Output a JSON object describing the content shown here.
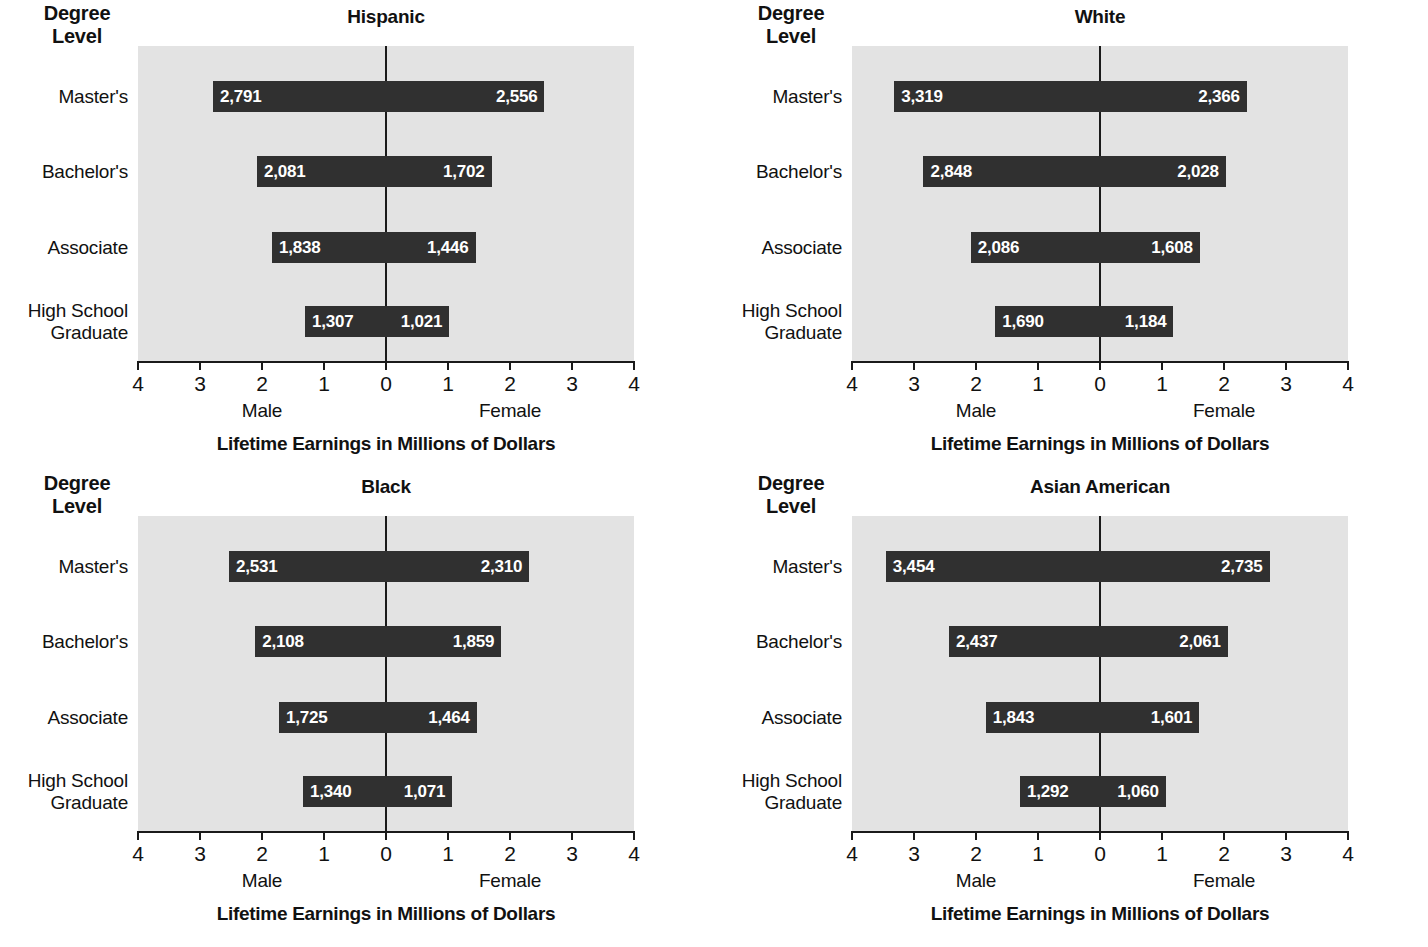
{
  "common": {
    "degree_level_heading": "Degree\nLevel",
    "degree_level_line1": "Degree",
    "degree_level_line2": "Level",
    "x_axis_title": "Lifetime Earnings in Millions of Dollars",
    "male_label": "Male",
    "female_label": "Female",
    "tick_labels": [
      "4",
      "3",
      "2",
      "1",
      "0",
      "1",
      "2",
      "3",
      "4"
    ],
    "tick_values": [
      -4,
      -3,
      -2,
      -1,
      0,
      1,
      2,
      3,
      4
    ],
    "categories": [
      "Master's",
      "Bachelor's",
      "Associate",
      "High School Graduate"
    ],
    "category_lines": [
      [
        "Master's"
      ],
      [
        "Bachelor's"
      ],
      [
        "Associate"
      ],
      [
        "High School",
        "Graduate"
      ]
    ],
    "colors": {
      "plot_background": "#e3e3e3",
      "bar_fill": "#303030",
      "axis": "#1a1a1a",
      "text": "#111111",
      "value_label": "#ffffff",
      "page_background": "#ffffff"
    }
  },
  "chart_data": [
    {
      "type": "bar",
      "orientation": "horizontal-diverging",
      "title": "Hispanic",
      "xlabel": "Lifetime Earnings in Millions of Dollars",
      "ylabel": "Degree Level",
      "xlim": [
        -4,
        4
      ],
      "xticks": [
        -4,
        -3,
        -2,
        -1,
        0,
        1,
        2,
        3,
        4
      ],
      "xticklabels": [
        "4",
        "3",
        "2",
        "1",
        "0",
        "1",
        "2",
        "3",
        "4"
      ],
      "grid": false,
      "legend": "none",
      "units": "thousands of dollars (bar labels); millions of dollars (axis)",
      "categories": [
        "Master's",
        "Bachelor's",
        "Associate",
        "High School Graduate"
      ],
      "series": [
        {
          "name": "Male",
          "side": "left",
          "values": [
            2791,
            2081,
            1838,
            1307
          ],
          "labels": [
            "2,791",
            "2,081",
            "1,838",
            "1,307"
          ]
        },
        {
          "name": "Female",
          "side": "right",
          "values": [
            2556,
            1702,
            1446,
            1021
          ],
          "labels": [
            "2,556",
            "1,702",
            "1,446",
            "1,021"
          ]
        }
      ]
    },
    {
      "type": "bar",
      "orientation": "horizontal-diverging",
      "title": "White",
      "xlabel": "Lifetime Earnings in Millions of Dollars",
      "ylabel": "Degree Level",
      "xlim": [
        -4,
        4
      ],
      "xticks": [
        -4,
        -3,
        -2,
        -1,
        0,
        1,
        2,
        3,
        4
      ],
      "xticklabels": [
        "4",
        "3",
        "2",
        "1",
        "0",
        "1",
        "2",
        "3",
        "4"
      ],
      "grid": false,
      "legend": "none",
      "units": "thousands of dollars (bar labels); millions of dollars (axis)",
      "categories": [
        "Master's",
        "Bachelor's",
        "Associate",
        "High School Graduate"
      ],
      "series": [
        {
          "name": "Male",
          "side": "left",
          "values": [
            3319,
            2848,
            2086,
            1690
          ],
          "labels": [
            "3,319",
            "2,848",
            "2,086",
            "1,690"
          ]
        },
        {
          "name": "Female",
          "side": "right",
          "values": [
            2366,
            2028,
            1608,
            1184
          ],
          "labels": [
            "2,366",
            "2,028",
            "1,608",
            "1,184"
          ]
        }
      ]
    },
    {
      "type": "bar",
      "orientation": "horizontal-diverging",
      "title": "Black",
      "xlabel": "Lifetime Earnings in Millions of Dollars",
      "ylabel": "Degree Level",
      "xlim": [
        -4,
        4
      ],
      "xticks": [
        -4,
        -3,
        -2,
        -1,
        0,
        1,
        2,
        3,
        4
      ],
      "xticklabels": [
        "4",
        "3",
        "2",
        "1",
        "0",
        "1",
        "2",
        "3",
        "4"
      ],
      "grid": false,
      "legend": "none",
      "units": "thousands of dollars (bar labels); millions of dollars (axis)",
      "categories": [
        "Master's",
        "Bachelor's",
        "Associate",
        "High School Graduate"
      ],
      "series": [
        {
          "name": "Male",
          "side": "left",
          "values": [
            2531,
            2108,
            1725,
            1340
          ],
          "labels": [
            "2,531",
            "2,108",
            "1,725",
            "1,340"
          ]
        },
        {
          "name": "Female",
          "side": "right",
          "values": [
            2310,
            1859,
            1464,
            1071
          ],
          "labels": [
            "2,310",
            "1,859",
            "1,464",
            "1,071"
          ]
        }
      ]
    },
    {
      "type": "bar",
      "orientation": "horizontal-diverging",
      "title": "Asian American",
      "xlabel": "Lifetime Earnings in Millions of Dollars",
      "ylabel": "Degree Level",
      "xlim": [
        -4,
        4
      ],
      "xticks": [
        -4,
        -3,
        -2,
        -1,
        0,
        1,
        2,
        3,
        4
      ],
      "xticklabels": [
        "4",
        "3",
        "2",
        "1",
        "0",
        "1",
        "2",
        "3",
        "4"
      ],
      "grid": false,
      "legend": "none",
      "units": "thousands of dollars (bar labels); millions of dollars (axis)",
      "categories": [
        "Master's",
        "Bachelor's",
        "Associate",
        "High School Graduate"
      ],
      "series": [
        {
          "name": "Male",
          "side": "left",
          "values": [
            3454,
            2437,
            1843,
            1292
          ],
          "labels": [
            "3,454",
            "2,437",
            "1,843",
            "1,292"
          ]
        },
        {
          "name": "Female",
          "side": "right",
          "values": [
            2735,
            2061,
            1601,
            1060
          ],
          "labels": [
            "2,735",
            "2,061",
            "1,601",
            "1,060"
          ]
        }
      ]
    }
  ]
}
